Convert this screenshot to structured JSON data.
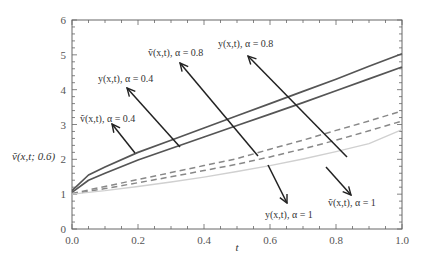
{
  "chart_data": {
    "type": "line",
    "title": "",
    "xlabel": "t",
    "ylabel": "ṽ(x,t; 0.6)",
    "xlim": [
      0.0,
      1.0
    ],
    "ylim": [
      0,
      6
    ],
    "xticks": [
      "0.0",
      "0.2",
      "0.4",
      "0.6",
      "0.8",
      "1.0"
    ],
    "yticks": [
      "0",
      "1",
      "2",
      "3",
      "4",
      "5",
      "6"
    ],
    "grid": false,
    "legend": "none (inline arrow annotations)",
    "x": [
      0.0,
      0.05,
      0.1,
      0.2,
      0.3,
      0.4,
      0.5,
      0.6,
      0.7,
      0.8,
      0.9,
      1.0
    ],
    "series": [
      {
        "name": "y(x,t), α=0.4",
        "style": "solid",
        "color": "#555555",
        "values": [
          1.1,
          1.55,
          1.78,
          2.2,
          2.55,
          2.9,
          3.25,
          3.6,
          3.95,
          4.3,
          4.67,
          5.03
        ]
      },
      {
        "name": "ṽ(x,t), α=0.4",
        "style": "solid",
        "color": "#555555",
        "values": [
          1.05,
          1.4,
          1.6,
          1.98,
          2.31,
          2.64,
          2.97,
          3.3,
          3.63,
          3.97,
          4.31,
          4.65
        ]
      },
      {
        "name": "y(x,t), α=0.8",
        "style": "dashed",
        "color": "#888888",
        "values": [
          1.02,
          1.12,
          1.22,
          1.42,
          1.62,
          1.82,
          2.02,
          2.29,
          2.55,
          2.83,
          3.1,
          3.39
        ]
      },
      {
        "name": "ṽ(x,t), α=0.8",
        "style": "dashed",
        "color": "#888888",
        "values": [
          1.0,
          1.08,
          1.16,
          1.33,
          1.5,
          1.68,
          1.86,
          2.07,
          2.3,
          2.55,
          2.82,
          3.1
        ]
      },
      {
        "name": "y(x,t), α=1 / ṽ(x,t), α=1",
        "style": "solid-light",
        "color": "#d0d0d0",
        "values": [
          1.0,
          1.05,
          1.1,
          1.22,
          1.35,
          1.49,
          1.65,
          1.82,
          2.01,
          2.22,
          2.45,
          2.85
        ]
      }
    ],
    "annotations": [
      {
        "text": "ṽ(x,t), α=0.4",
        "points_to": "solid lower curve"
      },
      {
        "text": "y(x,t), α=0.4",
        "points_to": "solid upper curve"
      },
      {
        "text": "ṽ(x,t), α=0.8",
        "points_to": "dashed lower curve"
      },
      {
        "text": "y(x,t), α=0.8",
        "points_to": "dashed upper curve"
      },
      {
        "text": "y(x,t), α=1",
        "points_to": "light curve"
      },
      {
        "text": "ṽ(x,t), α=1",
        "points_to": "light curve"
      }
    ]
  },
  "labels": {
    "xlabel": "t",
    "ylabel": "ṽ(x,t; 0.6)",
    "annot_v04": "ṽ(x,t), α = 0.4",
    "annot_y04": "y(x,t), α = 0.4",
    "annot_v08": "ṽ(x,t), α = 0.8",
    "annot_y08": "y(x,t), α = 0.8",
    "annot_y1": "y(x,t), α = 1",
    "annot_v1": "ṽ(x,t), α = 1"
  }
}
